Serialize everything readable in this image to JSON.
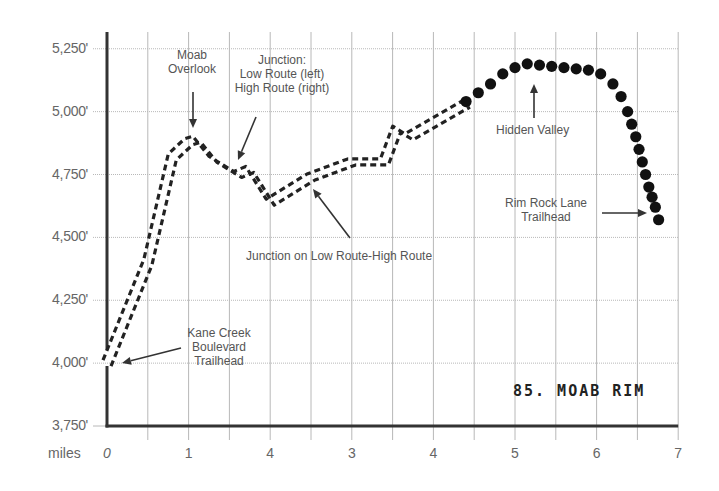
{
  "chart_data": {
    "type": "line",
    "title": "85. MOAB RIM",
    "xlabel": "miles",
    "ylabel": "",
    "x_ticks": [
      "0",
      "1",
      "4",
      "3",
      "4",
      "5",
      "6",
      "7"
    ],
    "x_tick_values": [
      0,
      1,
      2,
      3,
      4,
      5,
      6,
      7
    ],
    "y_ticks": [
      "5,250'",
      "5,000'",
      "4,750'",
      "4,500'",
      "4,250'",
      "4,000'",
      "3,750'"
    ],
    "y_tick_values": [
      5250,
      5000,
      4750,
      4500,
      4250,
      4000,
      3750
    ],
    "xlim": [
      0,
      7
    ],
    "ylim": [
      3750,
      5300
    ],
    "grid": true,
    "series": [
      {
        "name": "Trail (double dashed)",
        "style": "double-dashed",
        "x": [
          0,
          0.5,
          0.8,
          1.0,
          1.1,
          1.3,
          1.6,
          1.75,
          2.0,
          2.5,
          3.0,
          3.4,
          3.55,
          3.7,
          4.4
        ],
        "y": [
          4000,
          4400,
          4820,
          4880,
          4890,
          4810,
          4750,
          4770,
          4640,
          4740,
          4800,
          4800,
          4930,
          4900,
          5030
        ]
      },
      {
        "name": "Trail (dotted)",
        "style": "large-dots",
        "x": [
          4.4,
          4.55,
          4.7,
          4.85,
          5.0,
          5.15,
          5.3,
          5.45,
          5.6,
          5.75,
          5.9,
          6.05,
          6.2,
          6.3,
          6.38,
          6.43,
          6.48,
          6.52,
          6.56,
          6.6,
          6.64,
          6.68,
          6.72,
          6.76
        ],
        "y": [
          5040,
          5075,
          5110,
          5150,
          5175,
          5190,
          5185,
          5180,
          5175,
          5170,
          5165,
          5150,
          5110,
          5060,
          5000,
          4950,
          4900,
          4850,
          4800,
          4750,
          4700,
          4660,
          4620,
          4570
        ]
      }
    ],
    "annotations": [
      {
        "text": "Moab\nOverlook",
        "x": 1.1,
        "y": 4890
      },
      {
        "text": "Junction:\nLow Route (left)\nHigh Route (right)",
        "x": 1.6,
        "y": 4760
      },
      {
        "text": "Junction on Low Route-High Route",
        "x": 2.3,
        "y": 4700
      },
      {
        "text": "Hidden Valley",
        "x": 5.2,
        "y": 5180
      },
      {
        "text": "Rim Rock Lane\nTrailhead",
        "x": 6.75,
        "y": 4570
      },
      {
        "text": "Kane Creek\nBoulevard\nTrailhead",
        "x": 0.05,
        "y": 3990
      }
    ]
  },
  "labels": {
    "title": "85. MOAB RIM",
    "x_axis_name": "miles",
    "moab_overlook_1": "Moab",
    "moab_overlook_2": "Overlook",
    "junction_1": "Junction:",
    "junction_2": "Low Route (left)",
    "junction_3": "High Route (right)",
    "low_high_junction": "Junction on Low Route-High Route",
    "hidden_valley": "Hidden Valley",
    "rim_rock_1": "Rim Rock Lane",
    "rim_rock_2": "Trailhead",
    "kane_creek_1": "Kane Creek",
    "kane_creek_2": "Boulevard",
    "kane_creek_3": "Trailhead"
  }
}
